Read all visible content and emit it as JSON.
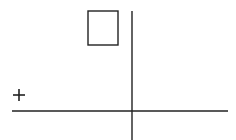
{
  "canvas": {
    "width": 236,
    "height": 140,
    "background": "#ffffff",
    "stroke": "#222222"
  },
  "shapes": {
    "square": {
      "x": 88,
      "y": 11,
      "width": 30,
      "height": 34
    },
    "plus": {
      "cx": 19,
      "cy": 95,
      "size": 12
    },
    "vertical_axis": {
      "x": 132,
      "y1": 11,
      "y2": 140
    },
    "horizontal_axis": {
      "y": 111,
      "x1": 12,
      "x2": 228
    }
  }
}
